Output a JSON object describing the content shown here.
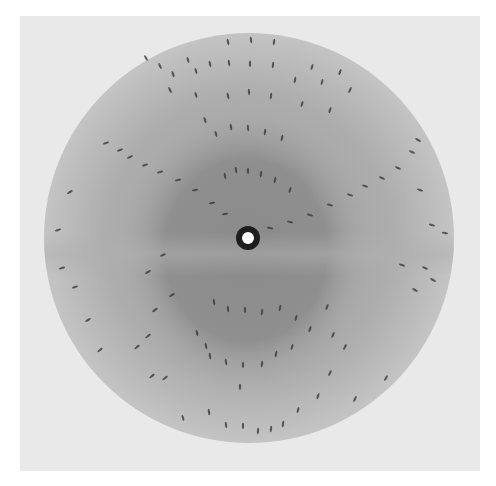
{
  "image": {
    "subject": "X-ray diffraction pattern",
    "width": 496,
    "height": 486,
    "background_color": "#ffffff",
    "film": {
      "x": 20,
      "y": 16,
      "width": 460,
      "height": 455,
      "color": "#e9e9e9"
    },
    "disc": {
      "cx": 249,
      "cy": 238,
      "r": 205,
      "edge_color": "#c2c2c2",
      "inner_color": "#b2b2b2"
    },
    "dark_core": {
      "cx": 246,
      "cy": 250,
      "rx": 125,
      "ry": 140,
      "color": "#8c8c8c"
    },
    "band": {
      "y": 240,
      "height": 34,
      "color": "#a4a4a4"
    },
    "beam_stop": {
      "cx": 248,
      "cy": 238,
      "outer_r": 12,
      "inner_r": 6,
      "ring_color": "#1e1e1e",
      "center_color": "#ffffff"
    },
    "spot_color": "#3a3a3a",
    "zero_layer_arc": {
      "left": [
        106,
        143
      ],
      "bottom": [
        248,
        236
      ],
      "right": [
        420,
        138
      ]
    },
    "spots": [
      [
        228,
        42,
        80
      ],
      [
        251,
        40,
        85
      ],
      [
        274,
        42,
        95
      ],
      [
        188,
        60,
        75
      ],
      [
        210,
        64,
        80
      ],
      [
        229,
        63,
        85
      ],
      [
        250,
        64,
        90
      ],
      [
        273,
        65,
        95
      ],
      [
        312,
        67,
        105
      ],
      [
        340,
        72,
        110
      ],
      [
        146,
        58,
        60
      ],
      [
        160,
        66,
        65
      ],
      [
        173,
        74,
        70
      ],
      [
        196,
        71,
        75
      ],
      [
        295,
        80,
        100
      ],
      [
        322,
        82,
        105
      ],
      [
        350,
        90,
        115
      ],
      [
        170,
        90,
        65
      ],
      [
        196,
        95,
        75
      ],
      [
        228,
        96,
        80
      ],
      [
        249,
        92,
        88
      ],
      [
        271,
        96,
        95
      ],
      [
        302,
        104,
        105
      ],
      [
        330,
        110,
        110
      ],
      [
        205,
        120,
        70
      ],
      [
        216,
        134,
        75
      ],
      [
        231,
        127,
        82
      ],
      [
        248,
        128,
        88
      ],
      [
        265,
        132,
        95
      ],
      [
        282,
        138,
        102
      ],
      [
        236,
        170,
        85
      ],
      [
        248,
        171,
        90
      ],
      [
        261,
        174,
        95
      ],
      [
        225,
        176,
        80
      ],
      [
        275,
        180,
        100
      ],
      [
        290,
        190,
        105
      ],
      [
        106,
        143,
        160
      ],
      [
        120,
        150,
        160
      ],
      [
        130,
        157,
        158
      ],
      [
        145,
        165,
        160
      ],
      [
        160,
        172,
        165
      ],
      [
        178,
        180,
        170
      ],
      [
        195,
        190,
        170
      ],
      [
        212,
        203,
        172
      ],
      [
        225,
        214,
        172
      ],
      [
        270,
        228,
        8
      ],
      [
        290,
        222,
        12
      ],
      [
        310,
        215,
        15
      ],
      [
        330,
        205,
        15
      ],
      [
        350,
        195,
        18
      ],
      [
        365,
        186,
        20
      ],
      [
        382,
        178,
        22
      ],
      [
        398,
        168,
        22
      ],
      [
        412,
        152,
        25
      ],
      [
        418,
        140,
        28
      ],
      [
        70,
        192,
        150
      ],
      [
        58,
        230,
        160
      ],
      [
        62,
        268,
        165
      ],
      [
        75,
        287,
        160
      ],
      [
        88,
        320,
        150
      ],
      [
        100,
        350,
        140
      ],
      [
        420,
        190,
        20
      ],
      [
        432,
        225,
        15
      ],
      [
        445,
        233,
        10
      ],
      [
        402,
        265,
        20
      ],
      [
        425,
        268,
        25
      ],
      [
        415,
        290,
        30
      ],
      [
        433,
        280,
        28
      ],
      [
        148,
        272,
        150
      ],
      [
        163,
        255,
        155
      ],
      [
        172,
        295,
        150
      ],
      [
        155,
        310,
        145
      ],
      [
        148,
        336,
        140
      ],
      [
        137,
        347,
        140
      ],
      [
        152,
        376,
        140
      ],
      [
        165,
        378,
        140
      ],
      [
        214,
        302,
        85
      ],
      [
        228,
        309,
        88
      ],
      [
        245,
        310,
        90
      ],
      [
        262,
        312,
        95
      ],
      [
        280,
        308,
        100
      ],
      [
        296,
        318,
        105
      ],
      [
        310,
        329,
        110
      ],
      [
        206,
        346,
        80
      ],
      [
        210,
        356,
        82
      ],
      [
        226,
        362,
        85
      ],
      [
        243,
        365,
        90
      ],
      [
        262,
        364,
        95
      ],
      [
        276,
        354,
        100
      ],
      [
        292,
        347,
        105
      ],
      [
        197,
        333,
        78
      ],
      [
        327,
        307,
        112
      ],
      [
        333,
        335,
        115
      ],
      [
        345,
        347,
        118
      ],
      [
        330,
        373,
        115
      ],
      [
        240,
        387,
        90
      ],
      [
        318,
        396,
        110
      ],
      [
        183,
        418,
        75
      ],
      [
        209,
        412,
        82
      ],
      [
        226,
        425,
        85
      ],
      [
        243,
        426,
        90
      ],
      [
        258,
        431,
        92
      ],
      [
        271,
        429,
        95
      ],
      [
        283,
        424,
        98
      ],
      [
        298,
        410,
        105
      ],
      [
        355,
        399,
        115
      ],
      [
        386,
        378,
        120
      ]
    ]
  }
}
